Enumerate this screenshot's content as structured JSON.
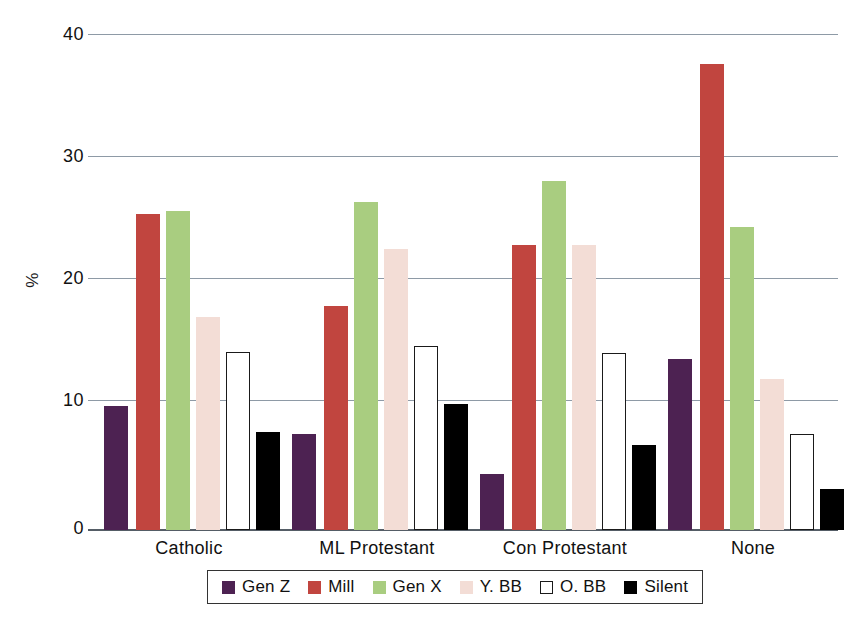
{
  "chart_data": {
    "type": "bar",
    "title": "",
    "subtitle": "",
    "xlabel": "",
    "ylabel": "%",
    "categories": [
      "Catholic",
      "ML Protestant",
      "Con Protestant",
      "None"
    ],
    "series": [
      {
        "name": "Gen Z",
        "color": "#4d2252",
        "values": [
          10.0,
          7.8,
          4.5,
          13.8
        ]
      },
      {
        "name": "Mill",
        "color": "#c1453f",
        "values": [
          25.5,
          18.1,
          23.0,
          37.7
        ]
      },
      {
        "name": "Gen X",
        "color": "#a9cd80",
        "values": [
          25.8,
          26.5,
          28.2,
          24.5
        ]
      },
      {
        "name": "Y. BB",
        "color": "#f3ddd6",
        "values": [
          17.2,
          22.7,
          23.0,
          12.2
        ]
      },
      {
        "name": "O. BB",
        "color": "#ffffff",
        "values": [
          14.4,
          14.9,
          14.3,
          7.8
        ]
      },
      {
        "name": "Silent",
        "color": "#000000",
        "values": [
          7.9,
          10.2,
          6.9,
          3.3
        ]
      }
    ],
    "ylim": [
      0,
      40
    ],
    "yticks": [
      0,
      10,
      20,
      30,
      40
    ],
    "ytick_labels": [
      "0",
      "10",
      "20",
      "30",
      "40"
    ],
    "grid": true,
    "legend_position": "bottom"
  },
  "axes": {
    "y_title": "%",
    "y_tick_labels": [
      "40",
      "30",
      "20",
      "10",
      "0"
    ],
    "x_tick_labels": [
      "Catholic",
      "ML Protestant",
      "Con Protestant",
      "None"
    ]
  },
  "legend": {
    "items": [
      {
        "label": "Gen Z",
        "swatch": "genz"
      },
      {
        "label": "Mill",
        "swatch": "mill"
      },
      {
        "label": "Gen X",
        "swatch": "genx"
      },
      {
        "label": "Y. BB",
        "swatch": "ybb"
      },
      {
        "label": "O. BB",
        "swatch": "obb"
      },
      {
        "label": "Silent",
        "swatch": "silent"
      }
    ]
  }
}
